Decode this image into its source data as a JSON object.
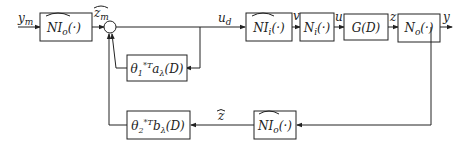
{
  "diagram": {
    "type": "block-diagram",
    "signals": {
      "input": "y_m",
      "z_m_hat": "ẑ_m",
      "u_d": "u_d",
      "v": "v",
      "u": "u",
      "z": "z",
      "output": "y",
      "z_hat": "ẑ"
    },
    "signal_display": {
      "input": "ym",
      "z_m_hat": "zm",
      "u_d": "ud",
      "v": "v",
      "u": "u",
      "z": "z",
      "output": "y",
      "z_hat": "z"
    },
    "blocks": [
      {
        "id": "ni_o_hat_forward",
        "label": "NIo(·)",
        "full": "\\widehat{NI}_o(·)"
      },
      {
        "id": "theta1_block",
        "label": "θ1*T aλ(D)",
        "full": "θ_1^{*T} a_λ(D)"
      },
      {
        "id": "ni_i_hat",
        "label": "NIi(·)",
        "full": "\\widehat{NI}_i(·)"
      },
      {
        "id": "n_i",
        "label": "Ni(·)",
        "full": "N_i(·)"
      },
      {
        "id": "g_d",
        "label": "G(D)",
        "full": "G(D)"
      },
      {
        "id": "n_o",
        "label": "No(·)",
        "full": "N_o(·)"
      },
      {
        "id": "theta2_block",
        "label": "θ2*T bλ(D)",
        "full": "θ_2^{*T} b_λ(D)"
      },
      {
        "id": "ni_o_hat_feedback",
        "label": "NIo(·)",
        "full": "\\widehat{NI}_o(·)"
      }
    ],
    "summing_junctions": [
      {
        "id": "sum1"
      }
    ]
  }
}
